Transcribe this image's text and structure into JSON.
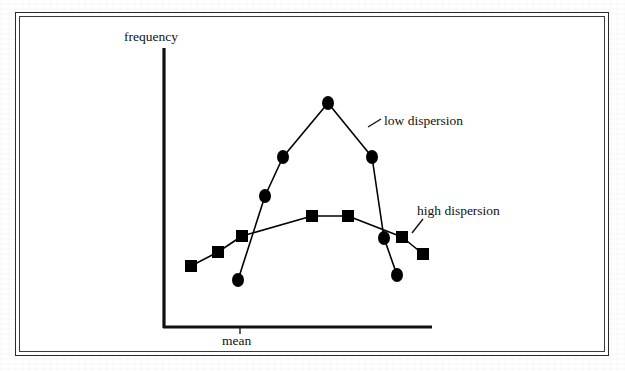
{
  "figure": {
    "axis_x_label": "mean",
    "axis_y_label": "frequency",
    "annotations": [
      {
        "label": "low dispersion"
      },
      {
        "label": "high dispersion"
      }
    ]
  },
  "chart_data": {
    "type": "line",
    "title": "",
    "subtitle": "",
    "xlabel": "mean",
    "ylabel": "frequency",
    "xlim": [
      0,
      10
    ],
    "ylim": [
      0,
      10
    ],
    "grid": false,
    "legend_position": "inline-annotation",
    "axis_ticks": {
      "x": [],
      "y": []
    },
    "annotations": [
      {
        "text": "low dispersion",
        "points_to_series": "low dispersion",
        "leader_from": [
          368,
          127
        ],
        "leader_to": [
          381,
          119
        ]
      },
      {
        "text": "high dispersion",
        "points_to_series": "high dispersion",
        "leader_from": [
          412,
          233
        ],
        "leader_to": [
          423,
          219
        ]
      }
    ],
    "series": [
      {
        "name": "low dispersion",
        "marker": "circle",
        "marker_size": 13,
        "color": "#000000",
        "x": [
          2.8,
          3.8,
          4.5,
          6.2,
          7.8,
          8.3,
          8.7
        ],
        "y": [
          1.7,
          4.7,
          6.1,
          8.0,
          6.1,
          3.2,
          1.9
        ],
        "points_px": [
          [
            238,
            280
          ],
          [
            265,
            196
          ],
          [
            283,
            157
          ],
          [
            328,
            103
          ],
          [
            372,
            157
          ],
          [
            384,
            238
          ],
          [
            397,
            275
          ]
        ]
      },
      {
        "name": "high dispersion",
        "marker": "square",
        "marker_size": 12,
        "color": "#000000",
        "x": [
          1.0,
          2.0,
          2.9,
          5.5,
          6.8,
          9.0,
          9.6
        ],
        "y": [
          2.2,
          2.7,
          3.3,
          4.0,
          4.0,
          3.3,
          2.7
        ],
        "points_px": [
          [
            191,
            266
          ],
          [
            218,
            252
          ],
          [
            242,
            236
          ],
          [
            312,
            216
          ],
          [
            348,
            216
          ],
          [
            402,
            237
          ],
          [
            423,
            254
          ]
        ]
      }
    ]
  },
  "background_ghost_text": [
    {
      "text": "the dispersion of the values",
      "x": 60,
      "y": 68
    },
    {
      "text": "of the distribution around",
      "x": 300,
      "y": 68
    },
    {
      "text": "a measure of central",
      "x": 250,
      "y": 95
    },
    {
      "text": "tendency such as the",
      "x": 60,
      "y": 155
    },
    {
      "text": "mean is referred to",
      "x": 330,
      "y": 155
    },
    {
      "text": "as the variability",
      "x": 90,
      "y": 205
    },
    {
      "text": "of the sample",
      "x": 470,
      "y": 205
    },
    {
      "text": "Variability",
      "x": 470,
      "y": 290
    },
    {
      "text": "the dispersion in each data set is different",
      "x": 40,
      "y": 315
    },
    {
      "text": "although the mean of each is the same",
      "x": 55,
      "y": 337
    }
  ]
}
